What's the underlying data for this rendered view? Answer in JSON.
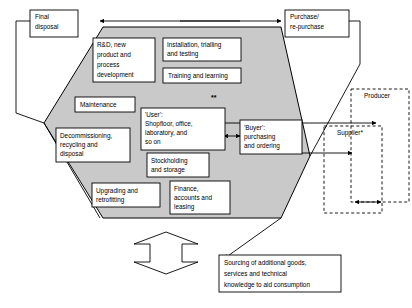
{
  "diagram": {
    "colors": {
      "hexagon_fill": "#c9c9c9",
      "box_fill": "#ffffff",
      "stroke": "#000000"
    },
    "outer_boxes": {
      "final_disposal": "Final\ndisposal",
      "final_disposal_lines": [
        "Final",
        "disposal"
      ],
      "purchase_repurchase_lines": [
        "Purchase/",
        "re-purchase"
      ],
      "sourcing_lines": [
        "Sourcing of additional goods,",
        "services and technical",
        "knowledge to aid consumption"
      ]
    },
    "actor_boxes": {
      "producer": "Producer",
      "supplier": "Supplier*"
    },
    "hexagon_boxes": [
      {
        "name": "rd-new-product",
        "lines": [
          "R&D, new",
          "product and",
          "process",
          "development"
        ]
      },
      {
        "name": "installation-trialling",
        "lines": [
          "Installation, trialling",
          "and testing"
        ]
      },
      {
        "name": "training-learning",
        "lines": [
          "Training and learning"
        ]
      },
      {
        "name": "maintenance",
        "lines": [
          "Maintenance"
        ]
      },
      {
        "name": "user",
        "lines": [
          "'User':",
          "Shopfloor, office,",
          "laboratory, and",
          "so on"
        ]
      },
      {
        "name": "buyer",
        "lines": [
          "'Buyer':",
          "purchasing",
          "and ordering"
        ]
      },
      {
        "name": "decommissioning",
        "lines": [
          "Decommissioning,",
          "recycling and",
          "disposal"
        ]
      },
      {
        "name": "stockholding",
        "lines": [
          "Stockholding",
          "and storage"
        ]
      },
      {
        "name": "upgrading-retrofitting",
        "lines": [
          "Upgrading and",
          "retrofitting"
        ]
      },
      {
        "name": "finance-accounts",
        "lines": [
          "Finance,",
          "accounts and",
          "leasing"
        ]
      }
    ],
    "annotations": {
      "double_asterisk": "**"
    }
  }
}
